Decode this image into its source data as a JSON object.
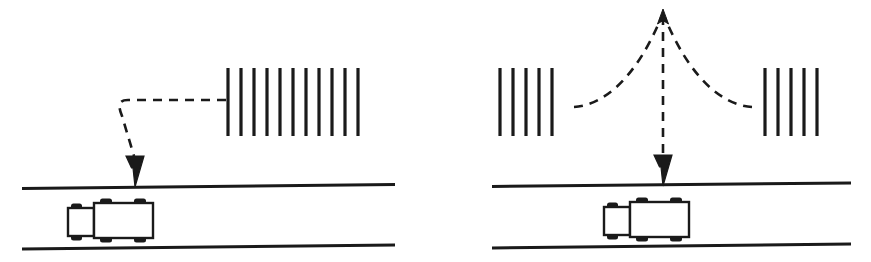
{
  "figure": {
    "type": "technical-line-diagram",
    "background_color": "#ffffff",
    "ink_color": "#1a1a1a",
    "width": 871,
    "height": 262,
    "panel_count": 2
  },
  "style": {
    "barrier_bar_width": 3.2,
    "road_line_width": 3.0,
    "vehicle_outline_width": 2.4,
    "dash_stroke_width": 2.6,
    "dash_pattern": "9,7"
  },
  "panels": [
    {
      "id": "left-panel",
      "name": "single-path-scenario",
      "barriers": [
        {
          "id": "left-panel-barrier",
          "name": "barrier-bar-group-right",
          "bar_count": 11,
          "x_start": 228,
          "x_spacing": 13.0,
          "y_top": 68,
          "y_bottom": 136
        }
      ],
      "road": {
        "top_line": {
          "x1": 22,
          "y1": 188,
          "x2": 395,
          "y2": 184
        },
        "bottom_line": {
          "x1": 22,
          "y1": 249,
          "x2": 395,
          "y2": 245
        }
      },
      "vehicle": {
        "id": "left-truck",
        "name": "truck",
        "cab": {
          "x": 68,
          "y": 208,
          "width": 26,
          "height": 28
        },
        "trailer": {
          "x": 95,
          "y": 203,
          "width": 58,
          "height": 35
        },
        "wheel_count": 6,
        "direction": "facing-left"
      },
      "path": {
        "id": "left-path",
        "name": "bent-sound-path",
        "shape": "horizontal-then-bend-down",
        "d": "M 226 100 L 128 100 C 118 100 118 106 122 116 L 135 158",
        "arrow": {
          "x": 135,
          "y": 186,
          "direction": "down"
        }
      }
    },
    {
      "id": "right-panel",
      "name": "split-path-scenario",
      "barriers": [
        {
          "id": "right-panel-barrier-left",
          "name": "barrier-bar-group-left",
          "bar_count": 5,
          "x_start": 500,
          "x_spacing": 13.0,
          "y_top": 68,
          "y_bottom": 136
        },
        {
          "id": "right-panel-barrier-right",
          "name": "barrier-bar-group-right",
          "bar_count": 5,
          "x_start": 765,
          "x_spacing": 13.0,
          "y_top": 68,
          "y_bottom": 136
        }
      ],
      "road": {
        "top_line": {
          "x1": 492,
          "y1": 186,
          "x2": 851,
          "y2": 183
        },
        "bottom_line": {
          "x1": 492,
          "y1": 248,
          "x2": 851,
          "y2": 244
        }
      },
      "vehicle": {
        "id": "right-truck",
        "name": "truck",
        "cab": {
          "x": 604,
          "y": 207,
          "width": 26,
          "height": 28
        },
        "trailer": {
          "x": 631,
          "y": 202,
          "width": 58,
          "height": 35
        },
        "wheel_count": 6,
        "direction": "facing-left"
      },
      "paths": {
        "left_curve": {
          "id": "right-panel-left-curve",
          "name": "curved-sound-path-left",
          "d": "M 574 107 C 602 106 636 80 662 16"
        },
        "right_curve": {
          "id": "right-panel-right-curve",
          "name": "curved-sound-path-right",
          "d": "M 752 107 C 724 106 690 80 664 16"
        },
        "vertical": {
          "id": "right-panel-vertical",
          "name": "vertical-sound-path",
          "d": "M 663 14 L 663 158",
          "arrow_down": {
            "x": 663,
            "y": 184,
            "direction": "down"
          },
          "arrow_up": {
            "x": 663,
            "y": 11,
            "direction": "up"
          }
        }
      }
    }
  ],
  "legend": {
    "barrier_label": "",
    "road_label": "",
    "vehicle_label": "",
    "path_label": ""
  }
}
